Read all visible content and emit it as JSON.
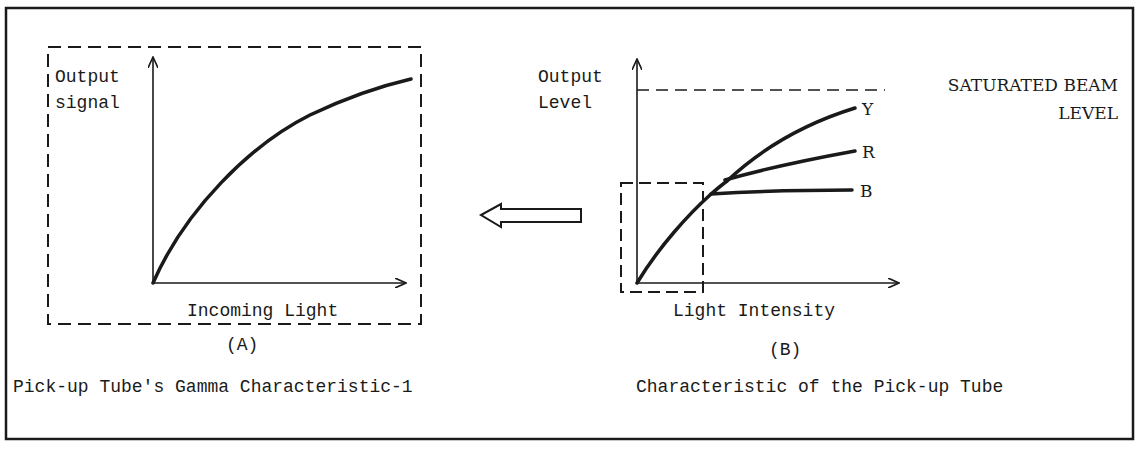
{
  "figure": {
    "panel_a": {
      "y_label_line1": "Output",
      "y_label_line2": "signal",
      "x_label": "Incoming Light",
      "tag": "(A)",
      "caption": "Pick-up Tube's Gamma Characteristic-1"
    },
    "panel_b": {
      "y_label_line1": "Output",
      "y_label_line2": "Level",
      "x_label": "Light Intensity",
      "saturation_label_line1": "SATURATED BEAM",
      "saturation_label_line2": "LEVEL",
      "curves": [
        {
          "name": "Y",
          "label": "Y"
        },
        {
          "name": "R",
          "label": "R"
        },
        {
          "name": "B",
          "label": "B"
        }
      ],
      "tag": "(B)",
      "caption": "Characteristic of the Pick-up Tube"
    },
    "arrow": {
      "direction": "left",
      "meaning": "zoomed region of B shown as A"
    },
    "colors": {
      "ink": "#1a1a1a",
      "background": "#ffffff"
    }
  }
}
